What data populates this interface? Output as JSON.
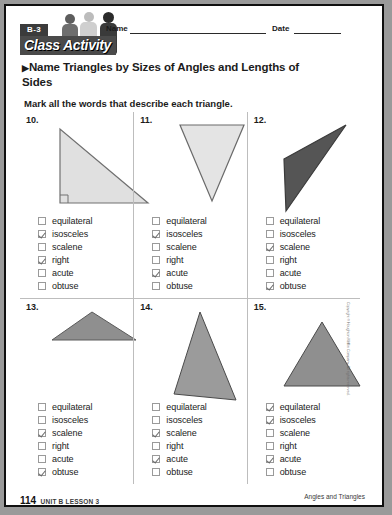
{
  "header": {
    "badge": "B-3",
    "banner_title": "Class Activity",
    "name_label": "Name",
    "date_label": "Date"
  },
  "title": {
    "arrow": "▶",
    "heading": "Name Triangles by Sizes of Angles and Lengths of Sides",
    "instruction": "Mark all the words that describe each triangle."
  },
  "choice_labels": [
    "equilateral",
    "isosceles",
    "scalene",
    "right",
    "acute",
    "obtuse"
  ],
  "problems": [
    {
      "number": "10.",
      "shape": "right-triangle",
      "fill": "#e0e0e0",
      "stroke": "#707070",
      "right_angle_mark": true,
      "points": "18,4 18,78 106,78",
      "checked": [
        "isosceles",
        "right"
      ]
    },
    {
      "number": "11.",
      "shape": "inverted-isosceles-triangle",
      "fill": "#e4e4e4",
      "stroke": "#6a6a6a",
      "right_angle_mark": false,
      "points": "18,4 82,4 50,80",
      "checked": [
        "isosceles",
        "acute"
      ]
    },
    {
      "number": "12.",
      "shape": "obtuse-scalene-triangle",
      "fill": "#555555",
      "stroke": "#3a3a3a",
      "right_angle_mark": false,
      "points": "14,38 76,4 16,90",
      "checked": [
        "scalene",
        "obtuse"
      ]
    },
    {
      "number": "13.",
      "shape": "flat-obtuse-triangle",
      "fill": "#8f8f8f",
      "stroke": "#5a5a5a",
      "right_angle_mark": false,
      "points": "12,32 52,4 96,32",
      "checked": [
        "scalene",
        "obtuse"
      ]
    },
    {
      "number": "14.",
      "shape": "tall-scalene-triangle",
      "fill": "#9b9b9b",
      "stroke": "#4a4a4a",
      "right_angle_mark": false,
      "points": "40,4 14,86 76,92",
      "checked": [
        "scalene",
        "acute"
      ]
    },
    {
      "number": "15.",
      "shape": "equilateral-triangle",
      "fill": "#8f8f8f",
      "stroke": "#4a4a4a",
      "right_angle_mark": false,
      "points": "50,6 12,70 88,70",
      "checked": [
        "equilateral",
        "isosceles",
        "acute"
      ]
    }
  ],
  "copyright": "Copyright © Houghton Mifflin Company. All rights reserved.",
  "footer": {
    "page_number": "114",
    "unit_lesson": "UNIT B LESSON 3",
    "lesson_title": "Angles and Triangles"
  }
}
